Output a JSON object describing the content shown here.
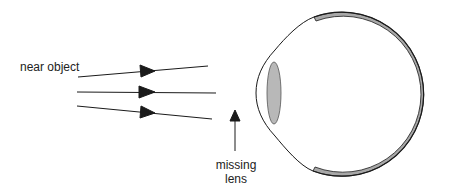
{
  "diagram": {
    "labels": {
      "near_object": "near object",
      "missing_lens_line1": "missing",
      "missing_lens_line2": "lens"
    },
    "colors": {
      "line": "#1a1a1a",
      "lens_fill": "#b8b8b8",
      "retina_fill": "#a8a8a8",
      "background": "#ffffff"
    },
    "rays": [
      {
        "from": [
          78,
          77
        ],
        "to": [
          208,
          66
        ]
      },
      {
        "from": [
          77,
          92
        ],
        "to": [
          216,
          93
        ]
      },
      {
        "from": [
          77,
          106
        ],
        "to": [
          212,
          119
        ]
      }
    ]
  }
}
